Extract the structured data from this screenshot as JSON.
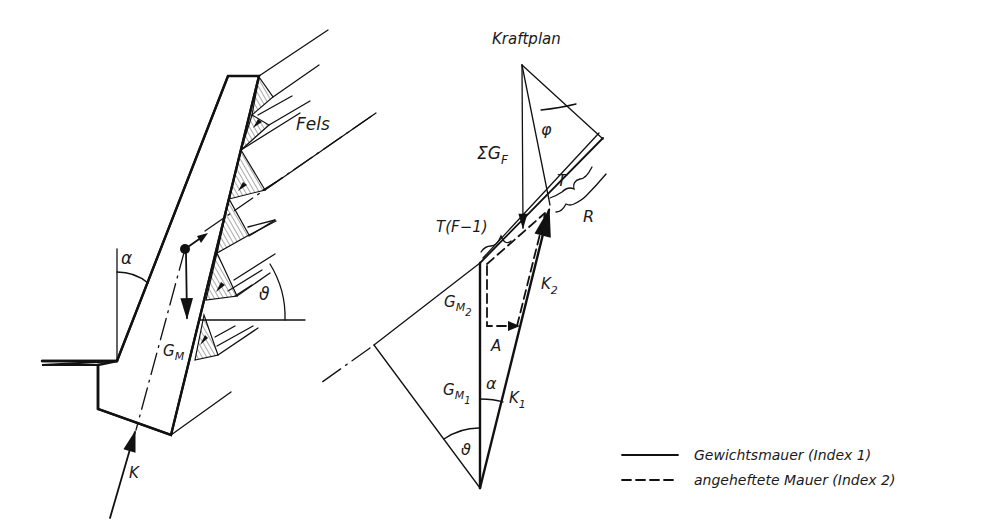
{
  "diagram": {
    "title": "Kraftplan",
    "wall_section": {
      "labels": {
        "rock": "Fels",
        "wall_weight": "G",
        "wall_weight_sub": "M",
        "support_force": "K",
        "wall_angle": "α",
        "joint_angle": "ϑ"
      }
    },
    "force_polygon": {
      "labels": {
        "rock_weight_sum": "ΣG",
        "rock_weight_sum_sub": "F",
        "friction_angle": "φ",
        "shear_force": "T",
        "resistance": "R",
        "shear_surplus": "T(F−1)",
        "k2": "K",
        "k2_sub": "2",
        "k1": "K",
        "k1_sub": "1",
        "gm2": "G",
        "gm2_sub": "M",
        "gm2_subsub": "2",
        "gm1": "G",
        "gm1_sub": "M",
        "gm1_subsub": "1",
        "anchor": "A",
        "alpha": "α",
        "theta": "ϑ"
      }
    },
    "legend": [
      {
        "line_style": "solid",
        "label": "Gewichtsmauer (Index 1)"
      },
      {
        "line_style": "dashed",
        "label": "angeheftete Mauer (Index 2)"
      }
    ],
    "colors": {
      "ink": "#111111",
      "background": "#ffffff",
      "hatch": "#555555"
    }
  }
}
